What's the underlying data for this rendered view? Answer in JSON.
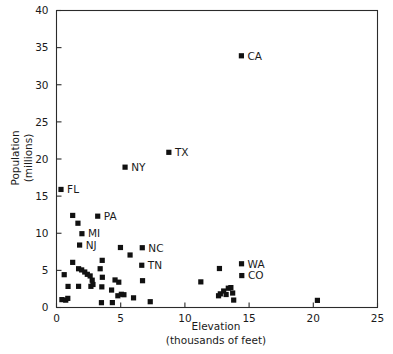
{
  "chart_data": {
    "type": "scatter",
    "title": "",
    "xlabel": "Elevation",
    "xlabel_sub": "(thousands of feet)",
    "ylabel": "Population",
    "ylabel_sub": "(millions)",
    "xlim": [
      0,
      25
    ],
    "ylim": [
      0,
      40
    ],
    "xticks": [
      0,
      5,
      10,
      15,
      20,
      25
    ],
    "yticks": [
      0,
      5,
      10,
      15,
      20,
      25,
      30,
      35,
      40
    ],
    "xtick_labels": [
      "0",
      "5",
      "10",
      "15",
      "20",
      "25"
    ],
    "ytick_labels": [
      "0",
      "5",
      "10",
      "15",
      "20",
      "25",
      "30",
      "35",
      "40"
    ],
    "grid": false,
    "legend": "none",
    "marker_style": "filled-square",
    "marker_color": "#111111",
    "points": [
      {
        "x": 14.4,
        "y": 33.9,
        "label": "CA"
      },
      {
        "x": 8.75,
        "y": 20.9,
        "label": "TX"
      },
      {
        "x": 5.34,
        "y": 18.9,
        "label": "NY"
      },
      {
        "x": 0.35,
        "y": 15.9,
        "label": "FL"
      },
      {
        "x": 3.21,
        "y": 12.3,
        "label": "PA"
      },
      {
        "x": 1.98,
        "y": 9.94,
        "label": "MI"
      },
      {
        "x": 1.8,
        "y": 8.41,
        "label": "NJ"
      },
      {
        "x": 6.68,
        "y": 8.05,
        "label": "NC"
      },
      {
        "x": 6.64,
        "y": 5.69,
        "label": "TN"
      },
      {
        "x": 14.41,
        "y": 5.89,
        "label": "WA"
      },
      {
        "x": 14.43,
        "y": 4.3,
        "label": "CO"
      },
      {
        "x": 1.26,
        "y": 12.4,
        "label": ""
      },
      {
        "x": 1.67,
        "y": 11.35,
        "label": ""
      },
      {
        "x": 4.98,
        "y": 8.08,
        "label": ""
      },
      {
        "x": 5.73,
        "y": 7.07,
        "label": ""
      },
      {
        "x": 1.26,
        "y": 6.08,
        "label": ""
      },
      {
        "x": 3.56,
        "y": 6.35,
        "label": ""
      },
      {
        "x": 1.72,
        "y": 5.22,
        "label": ""
      },
      {
        "x": 1.96,
        "y": 5.06,
        "label": ""
      },
      {
        "x": 2.2,
        "y": 4.78,
        "label": ""
      },
      {
        "x": 2.4,
        "y": 4.47,
        "label": ""
      },
      {
        "x": 2.62,
        "y": 4.25,
        "label": ""
      },
      {
        "x": 3.4,
        "y": 5.22,
        "label": ""
      },
      {
        "x": 0.6,
        "y": 4.42,
        "label": ""
      },
      {
        "x": 12.69,
        "y": 5.25,
        "label": ""
      },
      {
        "x": 11.24,
        "y": 3.45,
        "label": ""
      },
      {
        "x": 3.57,
        "y": 4.07,
        "label": ""
      },
      {
        "x": 2.78,
        "y": 3.68,
        "label": ""
      },
      {
        "x": 4.56,
        "y": 3.71,
        "label": ""
      },
      {
        "x": 6.7,
        "y": 3.61,
        "label": ""
      },
      {
        "x": 4.85,
        "y": 3.41,
        "label": ""
      },
      {
        "x": 0.9,
        "y": 2.84,
        "label": ""
      },
      {
        "x": 1.72,
        "y": 2.85,
        "label": ""
      },
      {
        "x": 2.68,
        "y": 2.85,
        "label": ""
      },
      {
        "x": 3.53,
        "y": 2.78,
        "label": ""
      },
      {
        "x": 2.84,
        "y": 3.1,
        "label": ""
      },
      {
        "x": 4.29,
        "y": 2.35,
        "label": ""
      },
      {
        "x": 5.05,
        "y": 1.78,
        "label": ""
      },
      {
        "x": 4.78,
        "y": 1.58,
        "label": ""
      },
      {
        "x": 5.25,
        "y": 1.72,
        "label": ""
      },
      {
        "x": 6.0,
        "y": 1.3,
        "label": ""
      },
      {
        "x": 0.42,
        "y": 1.06,
        "label": ""
      },
      {
        "x": 0.72,
        "y": 0.99,
        "label": ""
      },
      {
        "x": 0.88,
        "y": 1.23,
        "label": ""
      },
      {
        "x": 3.5,
        "y": 0.65,
        "label": ""
      },
      {
        "x": 4.35,
        "y": 0.66,
        "label": ""
      },
      {
        "x": 7.3,
        "y": 0.78,
        "label": ""
      },
      {
        "x": 12.62,
        "y": 1.58,
        "label": ""
      },
      {
        "x": 12.76,
        "y": 1.84,
        "label": ""
      },
      {
        "x": 13.02,
        "y": 2.22,
        "label": ""
      },
      {
        "x": 13.21,
        "y": 1.75,
        "label": ""
      },
      {
        "x": 13.38,
        "y": 2.6,
        "label": ""
      },
      {
        "x": 13.58,
        "y": 2.68,
        "label": ""
      },
      {
        "x": 13.72,
        "y": 1.95,
        "label": ""
      },
      {
        "x": 13.8,
        "y": 1.0,
        "label": ""
      },
      {
        "x": 20.32,
        "y": 0.96,
        "label": ""
      }
    ]
  }
}
